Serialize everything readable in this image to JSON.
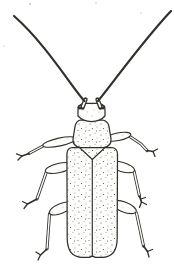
{
  "illustration": {
    "subject": "Ink line drawing of a longhorn beetle viewed from above, with two long curved antennae spreading to the top corners, six jointed legs and stippled shading on the body"
  },
  "colors": {
    "background": "#ffffff",
    "paper": "#fdfdfb",
    "ink": "#33302b",
    "stipple": "#57534c",
    "speck": "#bdbbb5"
  }
}
